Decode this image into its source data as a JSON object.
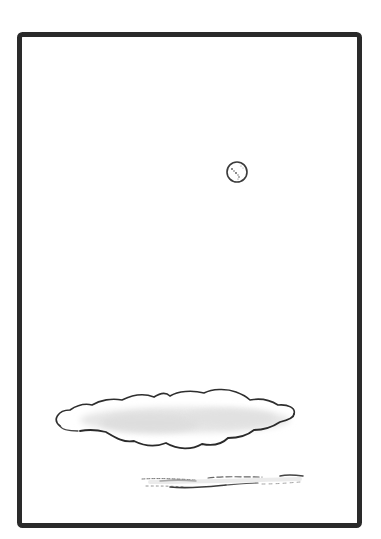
{
  "artwork": {
    "description": "Minimalist ink drawing of a moon over a long cloud within a black frame",
    "colors": {
      "background": "#ffffff",
      "frame": "#2a2a2a",
      "ink": "#333333",
      "cloud_fill": "#ececec"
    },
    "frame": {
      "x": 19,
      "y": 34,
      "width": 341,
      "height": 492,
      "stroke_width": 5,
      "corner_radius": 3
    },
    "moon": {
      "cx": 237,
      "cy": 172,
      "r": 10
    },
    "cloud": {
      "x_start": 55,
      "x_end": 296,
      "y_top": 390,
      "y_bottom": 449
    },
    "mist_lines": {
      "x_start": 142,
      "x_end": 304,
      "y": 480
    }
  }
}
